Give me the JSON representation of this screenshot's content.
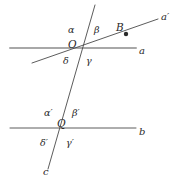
{
  "figure": {
    "type": "geometry-diagram",
    "background_color": "#ffffff",
    "stroke_color": "#4a4a4a",
    "line_a_color": "#a8a8a8",
    "label_color": "#2a2a2a"
  },
  "lines": {
    "a": {
      "label": "a",
      "label_x": 139,
      "label_y": 46,
      "x1": 10,
      "y1": 48,
      "x2": 136,
      "y2": 48,
      "color": "#a8a8a8",
      "width": 2.0
    },
    "a_prime": {
      "label": "a′",
      "label_x": 161,
      "label_y": 12,
      "x1": 32,
      "y1": 63,
      "x2": 158,
      "y2": 19,
      "color": "#4a4a4a",
      "width": 0.9
    },
    "b": {
      "label": "b",
      "label_x": 139,
      "label_y": 127,
      "x1": 10,
      "y1": 128,
      "x2": 136,
      "y2": 128,
      "color": "#4a4a4a",
      "width": 0.9
    },
    "c": {
      "label": "c",
      "label_x": 43,
      "label_y": 167,
      "x1": 95,
      "y1": 5,
      "x2": 48,
      "y2": 169,
      "color": "#4a4a4a",
      "width": 0.9
    }
  },
  "points": {
    "O": {
      "label": "O",
      "label_x": 68,
      "label_y": 39,
      "x": 80,
      "y": 46,
      "marked": false
    },
    "Q": {
      "label": "Q",
      "label_x": 57,
      "label_y": 118,
      "x": 62,
      "y": 126,
      "marked": false
    },
    "B": {
      "label": "B",
      "label_x": 116,
      "label_y": 22,
      "x": 126,
      "y": 34,
      "marked": true,
      "dot_radius": 2.2
    }
  },
  "angles_at_O": [
    {
      "name": "alpha",
      "label": "α",
      "x": 68,
      "y": 25,
      "position": "upper-left"
    },
    {
      "name": "beta",
      "label": "β",
      "x": 94,
      "y": 25,
      "position": "upper-right"
    },
    {
      "name": "gamma",
      "label": "γ",
      "x": 86,
      "y": 56,
      "position": "lower-right"
    },
    {
      "name": "delta",
      "label": "δ",
      "x": 63,
      "y": 56,
      "position": "lower-left"
    }
  ],
  "angles_at_Q": [
    {
      "name": "alpha-prime",
      "label": "α′",
      "x": 44,
      "y": 108,
      "position": "upper-left"
    },
    {
      "name": "beta-prime",
      "label": "β′",
      "x": 72,
      "y": 108,
      "position": "upper-right"
    },
    {
      "name": "gamma-prime",
      "label": "γ′",
      "x": 66,
      "y": 138,
      "position": "lower-right"
    },
    {
      "name": "delta-prime",
      "label": "δ′",
      "x": 40,
      "y": 138,
      "position": "lower-left"
    }
  ]
}
